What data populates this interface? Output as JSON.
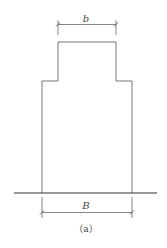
{
  "diagram": {
    "type": "cross-section elevation",
    "labels": {
      "top_width": "b",
      "bottom_width": "B"
    },
    "caption": "（a）",
    "colors": {
      "line": "#555555",
      "ground": "#333333",
      "background": "#ffffff"
    }
  }
}
